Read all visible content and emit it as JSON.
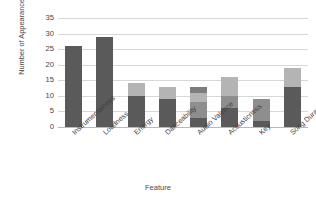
{
  "chart_data": {
    "type": "bar",
    "stacked": true,
    "title": "",
    "xlabel": "Feature",
    "ylabel": "Number of Appearances",
    "ylim": [
      0,
      35
    ],
    "yticks": [
      0,
      5,
      10,
      15,
      20,
      25,
      30,
      35
    ],
    "grid": true,
    "legend": "none",
    "categories": [
      "Instrumentalness",
      "Loudness",
      "Energy",
      "Danceability",
      "Audio Valence",
      "Acousticness",
      "Key",
      "Song Duration"
    ],
    "totals": [
      26,
      29,
      14,
      13,
      13,
      16,
      9,
      19
    ],
    "series": [
      {
        "name": "Segment 1",
        "color": "#5a5a5a",
        "values": [
          26,
          29,
          10,
          9,
          3,
          6,
          2,
          13
        ]
      },
      {
        "name": "Segment 2",
        "color": "#8e8e8e",
        "values": [
          0,
          0,
          0,
          0,
          5,
          4,
          7,
          0
        ]
      },
      {
        "name": "Segment 3",
        "color": "#b4b4b4",
        "values": [
          0,
          0,
          4,
          4,
          3,
          6,
          0,
          6
        ]
      },
      {
        "name": "Segment 4",
        "color": "#7c7c7c",
        "values": [
          0,
          0,
          0,
          0,
          2,
          0,
          0,
          0
        ]
      }
    ]
  },
  "axis": {
    "yticks": [
      "35",
      "30",
      "25",
      "20",
      "15",
      "10",
      "5",
      "0"
    ],
    "ylabel": "Number of Appearances",
    "xlabel": "Feature",
    "xticks": [
      "Instrumentalness",
      "Loudness",
      "Energy",
      "Danceability",
      "Audio Valence",
      "Acousticness",
      "Key",
      "Song Duration"
    ]
  },
  "colors": {
    "grid": "#d7d7d7",
    "axis": "#b9b9b9",
    "text": "#3f3f3f",
    "background": "#ffffff"
  }
}
